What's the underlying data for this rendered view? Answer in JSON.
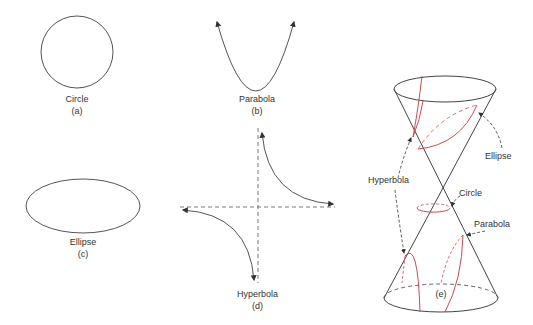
{
  "figure": {
    "panels": [
      {
        "id": "a",
        "shape": "Circle",
        "tag": "(a)"
      },
      {
        "id": "b",
        "shape": "Parabola",
        "tag": "(b)"
      },
      {
        "id": "c",
        "shape": "Ellipse",
        "tag": "(c)"
      },
      {
        "id": "d",
        "shape": "Hyperbola",
        "tag": "(d)"
      },
      {
        "id": "e",
        "shape": "Double cone sections",
        "tag": "(e)"
      }
    ],
    "cone_labels": {
      "ellipse": "Ellipse",
      "hyperbola": "Hyperbola",
      "circle": "Circle",
      "parabola": "Parabola"
    },
    "colors": {
      "line": "#444444",
      "section": "#d04a4a"
    }
  }
}
